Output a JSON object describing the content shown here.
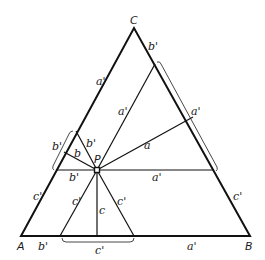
{
  "diagram": {
    "vertices": {
      "A": "A",
      "B": "B",
      "C": "C",
      "P": "P"
    },
    "labels": {
      "top_right_b_prime": "b'",
      "left_side_a_prime": "a'",
      "inner_a_prime": "a'",
      "right_bracket_a_prime": "a'",
      "perp_a": "a",
      "left_bracket_b_prime": "b'",
      "perp_b": "b",
      "upper_b_prime": "b'",
      "horizontal_b_prime": "b'",
      "horizontal_a_prime": "a'",
      "left_side_c_prime": "c'",
      "inner_left_c_prime": "c'",
      "perp_c": "c",
      "inner_right_c_prime": "c'",
      "right_side_c_prime": "c'",
      "base_b_prime": "b'",
      "base_bracket_c_prime": "c'",
      "base_a_prime": "a'"
    }
  }
}
